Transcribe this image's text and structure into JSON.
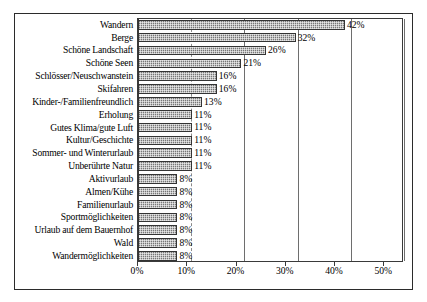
{
  "chart_data": {
    "type": "bar",
    "orientation": "horizontal",
    "title": "",
    "subtitle": "",
    "xlabel": "",
    "ylabel": "",
    "xlim": [
      0,
      54
    ],
    "xtick_labels": [
      "0%",
      "10%",
      "20%",
      "30%",
      "40%",
      "50%"
    ],
    "xtick_values": [
      0,
      10,
      20,
      30,
      40,
      50
    ],
    "grid": true,
    "grid_axis": "x",
    "legend": false,
    "legend_position": "none",
    "value_label_suffix": "%",
    "categories": [
      "Wandern",
      "Berge",
      "Schöne Landschaft",
      "Schöne Seen",
      "Schlösser/Neuschwanstein",
      "Skifahren",
      "Kinder-/Familienfreundlich",
      "Erholung",
      "Gutes Klima/gute Luft",
      "Kultur/Geschichte",
      "Sommer- und Winterurlaub",
      "Unberührte Natur",
      "Aktivurlaub",
      "Almen/Kühe",
      "Familienurlaub",
      "Sportmöglichkeiten",
      "Urlaub auf dem Bauernhof",
      "Wald",
      "Wandermöglichkeiten"
    ],
    "values": [
      42,
      32,
      26,
      21,
      16,
      16,
      13,
      11,
      11,
      11,
      11,
      11,
      8,
      8,
      8,
      8,
      8,
      8,
      8
    ],
    "value_labels": [
      "42%",
      "32%",
      "26%",
      "21%",
      "16%",
      "16%",
      "13%",
      "11%",
      "11%",
      "11%",
      "11%",
      "11%",
      "8%",
      "8%",
      "8%",
      "8%",
      "8%",
      "8%",
      "8%"
    ],
    "colors": {
      "bar_fill": "#a8a8a8",
      "bar_edge": "#343434",
      "gridline": "#6e6e6e",
      "axis": "#3a3a3a",
      "frame": "#2b2b2b",
      "text": "#000000",
      "background": "#ffffff"
    }
  }
}
